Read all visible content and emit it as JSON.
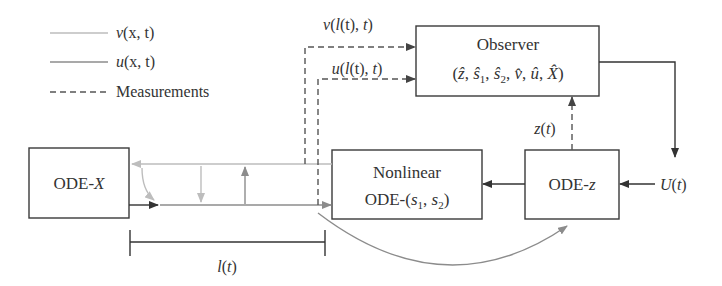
{
  "legend": {
    "items": [
      {
        "name": "v",
        "symbol": "v",
        "args": "(x, t)",
        "line_style": "solid-light-grey"
      },
      {
        "name": "u",
        "symbol": "u",
        "args": "(x, t)",
        "line_style": "solid-mid-grey"
      },
      {
        "name": "measurements",
        "label": "Measurements",
        "line_style": "dashed"
      }
    ]
  },
  "blocks": {
    "ode_x": {
      "prefix": "ODE-",
      "var": "X"
    },
    "nonlinear": {
      "line1": "Nonlinear",
      "line2_prefix": "ODE-(",
      "s": "s",
      "sub1": "1",
      "sep": ", ",
      "sub2": "2",
      "close": ")"
    },
    "ode_z": {
      "prefix": "ODE-",
      "var": "z"
    },
    "observer": {
      "title": "Observer",
      "states": {
        "open": "(",
        "z_hat": "ẑ",
        "sep1": ", ",
        "s1_hat": "ŝ",
        "s1_sub": "1",
        "sep2": ", ",
        "s2_hat": "ŝ",
        "s2_sub": "2",
        "sep3": ", ",
        "v_hat": "v̂",
        "sep4": ", ",
        "u_hat": "û",
        "sep5": ", ",
        "x_hat": "X̂",
        "close": ")"
      }
    }
  },
  "signals": {
    "v_measurement": {
      "fn": "v",
      "open": "(",
      "l": "l",
      "inner": "(t), ",
      "t": "t",
      "close": ")"
    },
    "u_measurement": {
      "fn": "u",
      "open": "(",
      "l": "l",
      "inner": "(t), ",
      "t": "t",
      "close": ")"
    },
    "z_measurement": {
      "fn": "z",
      "open": "(",
      "t": "t",
      "close": ")"
    },
    "input": {
      "fn": "U",
      "open": "(",
      "t": "t",
      "close": ")"
    },
    "length": {
      "fn": "l",
      "open": "(",
      "t": "t",
      "close": ")"
    }
  },
  "colors": {
    "v_line": "#bdbdbd",
    "u_line": "#8c8c8c",
    "dark_line": "#333333",
    "dashed_line": "#555555"
  }
}
